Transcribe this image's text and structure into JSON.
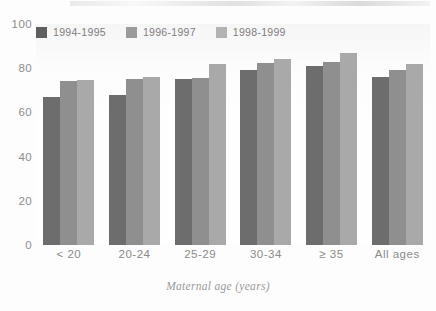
{
  "chart_data": {
    "type": "bar",
    "title": "",
    "subtitle": "",
    "xlabel": "Maternal age (years)",
    "ylabel": "",
    "categories": [
      "< 20",
      "20-24",
      "25-29",
      "30-34",
      "≥ 35",
      "All ages"
    ],
    "series": [
      {
        "name": "1994-1995",
        "color": "#6d6d6d",
        "values": [
          67,
          68,
          75,
          79,
          81,
          76
        ]
      },
      {
        "name": "1996-1997",
        "color": "#8f8f8f",
        "values": [
          74,
          75,
          75.5,
          82.5,
          83,
          79
        ]
      },
      {
        "name": "1998-1999",
        "color": "#a9a9a9",
        "values": [
          74.5,
          76,
          82,
          84,
          87,
          82
        ]
      }
    ],
    "ylim": [
      0,
      100
    ],
    "yticks": [
      0,
      20,
      40,
      60,
      80,
      100
    ],
    "ytick_labels": [
      "0",
      "20",
      "40",
      "60",
      "80",
      "100"
    ],
    "grid": false,
    "legend_position": "top-left",
    "bar_gap_within_group": 0,
    "annotations": []
  },
  "legend": {
    "items": [
      {
        "label": "1994-1995",
        "swatch": "legend-swatch-1994-1995"
      },
      {
        "label": "1996-1997",
        "swatch": "legend-swatch-1996-1997"
      },
      {
        "label": "1998-1999",
        "swatch": "legend-swatch-1998-1999"
      }
    ]
  },
  "axes": {
    "x_title": "Maternal age (years)",
    "y_ticks": [
      "100",
      "80",
      "60",
      "40",
      "20",
      "0"
    ],
    "x_ticks": [
      "< 20",
      "20-24",
      "25-29",
      "30-34",
      "≥ 35",
      "All ages"
    ]
  },
  "colors": {
    "series_1994_1995": "#6d6d6d",
    "series_1996_1997": "#8f8f8f",
    "series_1998_1999": "#a9a9a9",
    "axis_text": "#8a8a8a",
    "background": "#fdfdfd"
  }
}
